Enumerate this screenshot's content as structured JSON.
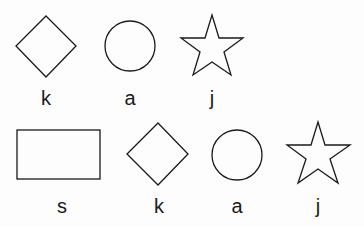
{
  "rows": [
    {
      "items": [
        {
          "shape": "diamond",
          "label": "k"
        },
        {
          "shape": "circle",
          "label": "a"
        },
        {
          "shape": "star",
          "label": "j"
        }
      ]
    },
    {
      "items": [
        {
          "shape": "rectangle",
          "label": "s"
        },
        {
          "shape": "diamond",
          "label": "k"
        },
        {
          "shape": "circle",
          "label": "a"
        },
        {
          "shape": "star",
          "label": "j"
        }
      ]
    }
  ],
  "colors": {
    "stroke": "#1a1a1a",
    "background": "#fdfdfd"
  }
}
